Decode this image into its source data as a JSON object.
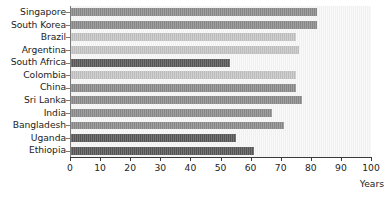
{
  "chart_data": {
    "type": "bar",
    "orientation": "horizontal",
    "title": "",
    "xlabel": "Years",
    "ylabel": "",
    "xlim": [
      0,
      100
    ],
    "grid": false,
    "legend": null,
    "xticks": [
      0,
      10,
      20,
      30,
      40,
      50,
      60,
      70,
      80,
      90,
      100
    ],
    "xtick_labels": [
      "0",
      "10",
      "20",
      "30",
      "40",
      "50",
      "60",
      "70",
      "80",
      "90",
      "100"
    ],
    "categories": [
      "Singapore",
      "South Korea",
      "Brazil",
      "Argentina",
      "South Africa",
      "Colombia",
      "China",
      "Sri Lanka",
      "India",
      "Bangladesh",
      "Uganda",
      "Ethiopia"
    ],
    "values": [
      82,
      82,
      75,
      76,
      53,
      75,
      75,
      77,
      67,
      71,
      55,
      61
    ],
    "bar_shades": [
      "mid",
      "mid",
      "light",
      "light",
      "dark",
      "light",
      "mid",
      "mid",
      "mid",
      "mid",
      "dark",
      "dark"
    ],
    "colors": {
      "light": "#c6c6c6",
      "mid": "#8d8d8d",
      "dark": "#5a5a5a",
      "plot_background": "#f2f2f2",
      "axis": "#3a3a3a",
      "text": "#1d1d1d"
    }
  }
}
